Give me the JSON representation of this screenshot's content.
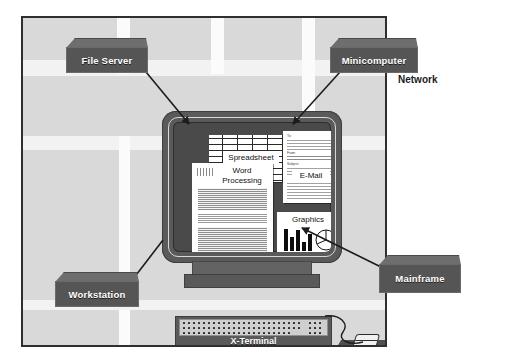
{
  "diagram": {
    "network_label": "Network",
    "background_color": "#d9d9d9",
    "frame_border_color": "#2f2f2f",
    "callout_face_color": "#555555",
    "callout_top_color": "#6e6e6e",
    "callout_text_color": "#ffffff"
  },
  "callouts": [
    {
      "id": "file-server",
      "label": "File Server"
    },
    {
      "id": "minicomputer",
      "label": "Minicomputer"
    },
    {
      "id": "mainframe",
      "label": "Mainframe"
    },
    {
      "id": "workstation",
      "label": "Workstation"
    },
    {
      "id": "x-terminal",
      "label": "X-Terminal"
    }
  ],
  "screen_windows": [
    {
      "id": "spreadsheet",
      "title": "Spreadsheet",
      "kind": "grid"
    },
    {
      "id": "word",
      "title": "Word Processing",
      "kind": "text"
    },
    {
      "id": "email",
      "title": "E-Mail",
      "kind": "form"
    },
    {
      "id": "graphics",
      "title": "Graphics",
      "kind": "chart"
    }
  ],
  "email_fields": [
    {
      "label": "To:"
    },
    {
      "label": "From:"
    },
    {
      "label": "Subject:"
    }
  ],
  "chart_data": {
    "type": "bar",
    "title": "Graphics",
    "categories": [
      "1",
      "2",
      "3",
      "4",
      "5"
    ],
    "values": [
      22,
      14,
      21,
      9,
      17
    ],
    "xlabel": "",
    "ylabel": "",
    "ylim": [
      0,
      24
    ],
    "grid": false,
    "legend": "none",
    "companion": {
      "type": "pie",
      "slices": [
        40,
        35,
        25
      ]
    }
  },
  "device": {
    "monitor_name": "Monitor",
    "keyboard_name": "Keyboard",
    "mouse_name": "Mouse",
    "mousepad_name": "Mouse pad"
  }
}
